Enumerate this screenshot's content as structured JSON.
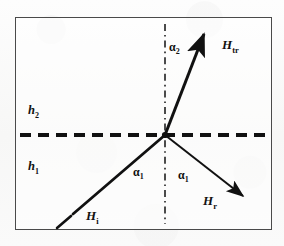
{
  "figure": {
    "kind": "optics-refraction-reflection-diagram",
    "frame": {
      "border_color": "#4a4a4a"
    },
    "background_color": "#fbfbfb",
    "ink_color": "#111111"
  },
  "labels": {
    "medium_upper": {
      "base": "h",
      "sub": "2"
    },
    "medium_lower": {
      "base": "h",
      "sub": "1"
    },
    "incident_wave": {
      "base": "H",
      "sub": "i"
    },
    "reflected_wave": {
      "base": "H",
      "sub": "r"
    },
    "transmitted_wave": {
      "base": "H",
      "sub": "tr"
    },
    "angle_incidence": {
      "base": "α",
      "sub": "1"
    },
    "angle_reflection": {
      "base": "α",
      "sub": "1"
    },
    "angle_transmission": {
      "base": "α",
      "sub": "2"
    }
  },
  "geometry": {
    "vertex": {
      "x": 165,
      "y": 135
    },
    "interface_line": {
      "x1": 20,
      "y1": 135,
      "x2": 268,
      "y2": 135,
      "style": "dashed",
      "width": 4.2
    },
    "normal_line": {
      "x1": 165,
      "y1": 24,
      "x2": 165,
      "y2": 224,
      "style": "dash-dot",
      "width": 1.5
    },
    "incident_ray": {
      "x1": 73,
      "y1": 214,
      "x2": 165,
      "y2": 135,
      "width": 2.8,
      "arrow": false
    },
    "incident_tail": {
      "x1": 57,
      "y1": 228,
      "x2": 71,
      "y2": 216,
      "width": 2.6
    },
    "reflected_ray": {
      "x1": 165,
      "y1": 135,
      "x2": 248,
      "y2": 200,
      "width": 2.0,
      "arrow": true
    },
    "transmitted_ray": {
      "x1": 165,
      "y1": 135,
      "x2": 206,
      "y2": 29,
      "width": 3.0,
      "arrow": true
    }
  }
}
